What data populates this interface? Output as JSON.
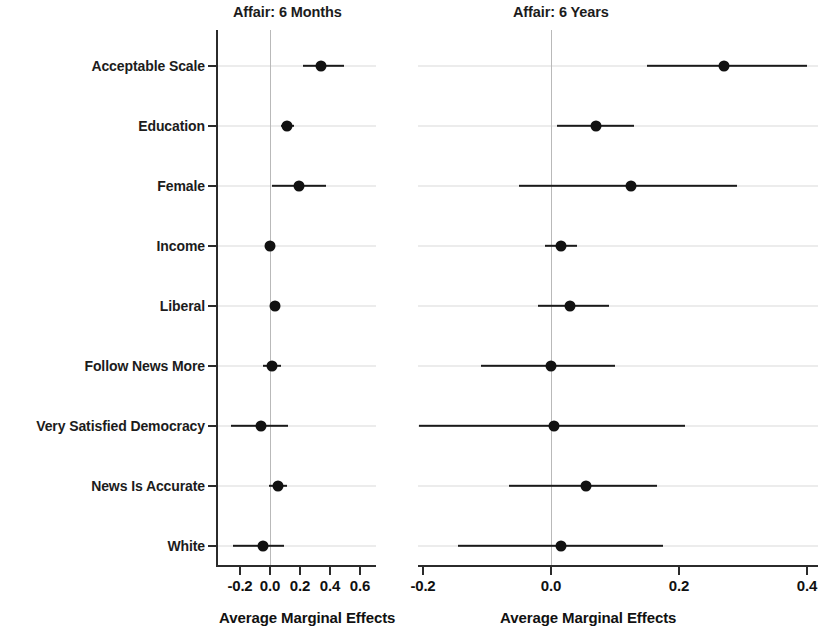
{
  "chart_data": {
    "type": "scatter",
    "plot_style": "coefficient-plot",
    "title": "",
    "xlabel": "Average Marginal Effects",
    "ylabel": "",
    "grid": true,
    "legend": null,
    "categories": [
      "Acceptable Scale",
      "Education",
      "Female",
      "Income",
      "Liberal",
      "Follow News More",
      "Very Satisfied Democracy",
      "News Is Accurate",
      "White"
    ],
    "panels": [
      {
        "title": "Affair: 6 Months",
        "xlabel": "Average Marginal Effects",
        "xlim": [
          -0.29,
          0.7
        ],
        "xticks": [
          -0.2,
          0.0,
          0.2,
          0.4,
          0.6
        ],
        "xticklabels": [
          "-0.2",
          "0.0",
          "0.2",
          "0.4",
          "0.6"
        ],
        "points": [
          {
            "category": "Acceptable Scale",
            "estimate": 0.34,
            "ci_low": 0.22,
            "ci_high": 0.49
          },
          {
            "category": "Education",
            "estimate": 0.11,
            "ci_low": 0.07,
            "ci_high": 0.16
          },
          {
            "category": "Female",
            "estimate": 0.19,
            "ci_low": 0.01,
            "ci_high": 0.37
          },
          {
            "category": "Income",
            "estimate": 0.0,
            "ci_low": -0.02,
            "ci_high": 0.02
          },
          {
            "category": "Liberal",
            "estimate": 0.03,
            "ci_low": 0.0,
            "ci_high": 0.06
          },
          {
            "category": "Follow News More",
            "estimate": 0.01,
            "ci_low": -0.05,
            "ci_high": 0.07
          },
          {
            "category": "Very Satisfied Democracy",
            "estimate": -0.06,
            "ci_low": -0.26,
            "ci_high": 0.12
          },
          {
            "category": "News Is Accurate",
            "estimate": 0.05,
            "ci_low": -0.01,
            "ci_high": 0.11
          },
          {
            "category": "White",
            "estimate": -0.05,
            "ci_low": -0.25,
            "ci_high": 0.09
          }
        ]
      },
      {
        "title": "Affair: 6 Years",
        "xlabel": "Average Marginal Effects",
        "xlim": [
          -0.25,
          0.42
        ],
        "xticks": [
          -0.2,
          0.0,
          0.2,
          0.4
        ],
        "xticklabels": [
          "-0.2",
          "0.0",
          "0.2",
          "0.4"
        ],
        "points": [
          {
            "category": "Acceptable Scale",
            "estimate": 0.27,
            "ci_low": 0.15,
            "ci_high": 0.4
          },
          {
            "category": "Education",
            "estimate": 0.07,
            "ci_low": 0.01,
            "ci_high": 0.13
          },
          {
            "category": "Female",
            "estimate": 0.125,
            "ci_low": -0.05,
            "ci_high": 0.29
          },
          {
            "category": "Income",
            "estimate": 0.015,
            "ci_low": -0.01,
            "ci_high": 0.04
          },
          {
            "category": "Liberal",
            "estimate": 0.03,
            "ci_low": -0.02,
            "ci_high": 0.09
          },
          {
            "category": "Follow News More",
            "estimate": 0.0,
            "ci_low": -0.11,
            "ci_high": 0.1
          },
          {
            "category": "Very Satisfied Democracy",
            "estimate": 0.005,
            "ci_low": -0.21,
            "ci_high": 0.21
          },
          {
            "category": "News Is Accurate",
            "estimate": 0.055,
            "ci_low": -0.065,
            "ci_high": 0.165
          },
          {
            "category": "White",
            "estimate": 0.015,
            "ci_low": -0.145,
            "ci_high": 0.175
          }
        ]
      }
    ]
  }
}
